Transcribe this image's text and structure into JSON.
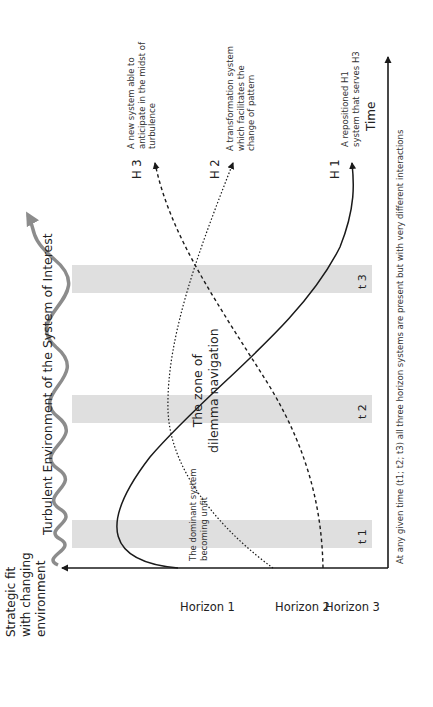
{
  "diagram": {
    "y_axis_label": [
      "Strategic fit",
      "with changing",
      "environment"
    ],
    "x_axis_label": "Time",
    "environment_label": "Turbulent Environment of the System of Interest",
    "zone_label": [
      "The zone of",
      "dilemma navigation"
    ],
    "dominant_note": [
      "The dominant system",
      "becoming unfit"
    ],
    "footnote": "At any given time (t1; t2; t3) all three horizon systems are present but with very different interactions",
    "horizons": [
      {
        "start_label": "Horizon 1",
        "end_label": "H 1",
        "line_style": "solid",
        "description": [
          "A repositioned H1",
          "system that serves H3"
        ]
      },
      {
        "start_label": "Horizon 2",
        "end_label": "H 2",
        "line_style": "dotted",
        "description": [
          "A transformation system",
          "which facilitates the",
          "change of pattern"
        ]
      },
      {
        "start_label": "Horizon 3",
        "end_label": "H 3",
        "line_style": "dashed",
        "description": [
          "A new system able to",
          "anticipate in the midst of",
          "turbulence"
        ]
      }
    ],
    "time_bands": [
      {
        "label": "t 1"
      },
      {
        "label": "t 2"
      },
      {
        "label": "t 3"
      }
    ],
    "colors": {
      "band": "#d9d9d9",
      "wave": "#8c8c8c",
      "lines": "#1a1a1a"
    }
  }
}
